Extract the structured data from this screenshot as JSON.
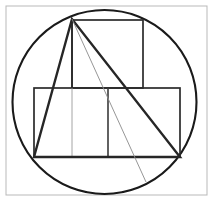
{
  "canvas": {
    "width": 213,
    "height": 204,
    "background": "#ffffff",
    "title": "Geometric construction: circle with inscribed triangle, square and rectangle"
  },
  "palette": {
    "frame_stroke": "#b9b9b9",
    "circle_stroke": "#1a1a1a",
    "triangle_stroke": "#262626",
    "square_stroke": "#2b2b2b",
    "rectangle_stroke": "#2b2b2b",
    "divider_dark_stroke": "#3a3a3a",
    "divider_light_stroke": "#9a9a9a",
    "thin_ray_stroke": "#8a8a8a",
    "fill": "none"
  },
  "strokes": {
    "frame_width": 1,
    "circle_width": 2.1,
    "triangle_width": 2.4,
    "square_width": 1.7,
    "rectangle_width": 1.7,
    "divider_dark_width": 1.6,
    "divider_light_width": 0.9,
    "thin_ray_width": 0.9
  },
  "chart_data": {
    "type": "diagram",
    "title": "Circle with inscribed triangle, square and rectangle",
    "coordinate_system": "pixels, origin top-left",
    "shapes": [
      {
        "name": "outer-frame",
        "kind": "rect",
        "x": 6,
        "y": 6,
        "width": 201,
        "height": 189
      },
      {
        "name": "circle",
        "kind": "circle",
        "cx": 104.5,
        "cy": 102,
        "r": 92
      },
      {
        "name": "top-square",
        "kind": "rect",
        "x": 72,
        "y": 20,
        "width": 71,
        "height": 68
      },
      {
        "name": "lower-rectangle",
        "kind": "rect",
        "x": 34,
        "y": 88,
        "width": 146,
        "height": 69
      },
      {
        "name": "triangle",
        "kind": "polygon",
        "points": "72,19 34,157 180,157"
      },
      {
        "name": "rectangle-divider-dark",
        "kind": "line",
        "x1": 108,
        "y1": 88,
        "x2": 108,
        "y2": 157
      },
      {
        "name": "rectangle-divider-light",
        "kind": "line",
        "x1": 72,
        "y1": 88,
        "x2": 72,
        "y2": 157
      },
      {
        "name": "square-left-edge-extension",
        "kind": "line",
        "x1": 72,
        "y1": 19,
        "x2": 72,
        "y2": 88
      },
      {
        "name": "thin-ray-to-circle",
        "kind": "line",
        "x1": 72,
        "y1": 19,
        "x2": 146,
        "y2": 182
      }
    ],
    "points": [
      {
        "name": "apex",
        "x": 72,
        "y": 19,
        "on_circle": true
      },
      {
        "name": "triangle-bottom-left",
        "x": 34,
        "y": 157,
        "on_circle": true
      },
      {
        "name": "triangle-bottom-right",
        "x": 180,
        "y": 157,
        "on_circle": true
      },
      {
        "name": "thin-ray-terminus",
        "x": 146,
        "y": 182,
        "on_circle": true
      }
    ]
  }
}
